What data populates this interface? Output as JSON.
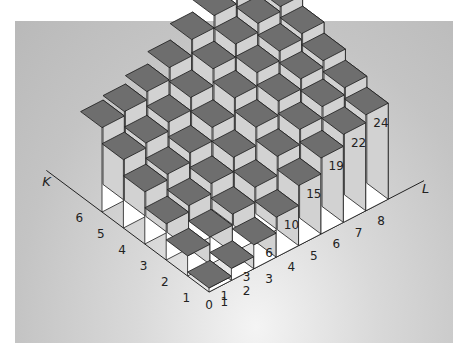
{
  "chart_data": {
    "type": "bar3d",
    "title": "",
    "x_axis": {
      "label": "L",
      "ticks": [
        "0",
        "1",
        "2",
        "3",
        "4",
        "5",
        "6",
        "7",
        "8"
      ]
    },
    "y_axis": {
      "label": "K",
      "ticks": [
        "1",
        "2",
        "3",
        "4",
        "5",
        "6"
      ]
    },
    "front_row_labels": {
      "K": 1,
      "L": [
        1,
        2,
        3,
        4,
        5,
        6,
        7,
        8
      ],
      "values": [
        1,
        3,
        6,
        10,
        15,
        19,
        22,
        24
      ]
    },
    "grid": false,
    "legend": null,
    "colors": {
      "top": "#6e6e6e",
      "right_face": "#ffffff",
      "left_face": "#d2d2d2",
      "edge": "#1a1a1a"
    }
  },
  "labels": {
    "k_axis": "K",
    "l_axis": "L",
    "origin": "0",
    "k_ticks": [
      "1",
      "2",
      "3",
      "4",
      "5",
      "6"
    ],
    "l_ticks": [
      "1",
      "2",
      "3",
      "4",
      "5",
      "6",
      "7",
      "8"
    ],
    "values": [
      "1",
      "3",
      "6",
      "10",
      "15",
      "19",
      "22",
      "24"
    ]
  }
}
